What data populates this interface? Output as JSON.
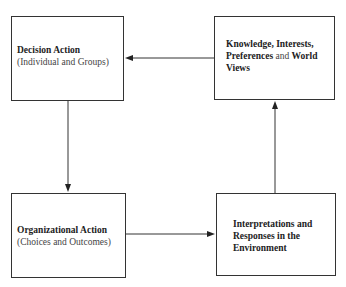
{
  "diagram": {
    "type": "cycle-flow",
    "nodes": [
      {
        "id": "decision-action",
        "title": "Decision Action",
        "subtitle": "(Individual and Groups)"
      },
      {
        "id": "knowledge",
        "line1_bold_a": "Knowledge, Interests,",
        "line2_bold_a": "Preferences",
        "line2_normal": " and ",
        "line2_bold_b": "World",
        "line3_bold": "Views"
      },
      {
        "id": "organizational-action",
        "title": "Organizational Action",
        "subtitle": "(Choices and Outcomes)"
      },
      {
        "id": "interpretations",
        "line1": "Interpretations and",
        "line2": "Responses in the",
        "line3": "Environment"
      }
    ],
    "edges": [
      {
        "from": "knowledge",
        "to": "decision-action"
      },
      {
        "from": "decision-action",
        "to": "organizational-action"
      },
      {
        "from": "organizational-action",
        "to": "interpretations"
      },
      {
        "from": "interpretations",
        "to": "knowledge"
      }
    ]
  }
}
